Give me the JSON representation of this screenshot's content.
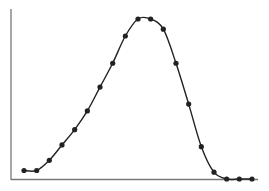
{
  "chart_data": {
    "type": "line",
    "title": "",
    "xlabel": "",
    "ylabel": "",
    "grid": false,
    "legend": null,
    "markers": true,
    "smooth": true,
    "x": [
      1,
      2,
      3,
      4,
      5,
      6,
      7,
      8,
      9,
      10,
      11,
      12,
      13,
      14,
      15,
      16,
      17,
      18,
      19
    ],
    "series": [
      {
        "name": "",
        "values": [
          5,
          5,
          11,
          20,
          29,
          40,
          54,
          68,
          84,
          94,
          94,
          88,
          68,
          44,
          19,
          4,
          0,
          0,
          0
        ]
      }
    ],
    "colors": {
      "line": "#222222",
      "marker": "#222222",
      "axis": "#777777"
    }
  }
}
